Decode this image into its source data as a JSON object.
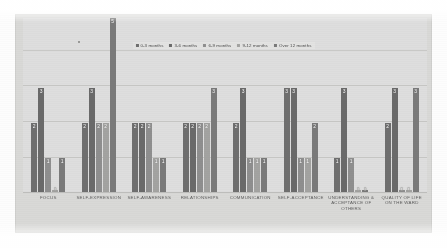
{
  "chart_data": {
    "type": "bar",
    "title": "",
    "xlabel": "",
    "ylabel": "",
    "ylim": [
      0,
      5
    ],
    "grid": true,
    "legend_position": "top-center",
    "categories": [
      "FOCUS",
      "SELF-EXPRESSION",
      "SELF-AWARENESS",
      "RELATIONSHIPS",
      "COMMUNICATION",
      "SELF-ACCEPTANCE",
      "UNDERSTANDING & ACCEPTANCE OF OTHERS",
      "QUALITY OF LIFE ON THE WARD"
    ],
    "series": [
      {
        "name": "0-3 months",
        "color": "#6f6f6f",
        "values": [
          2,
          2,
          2,
          2,
          2,
          3,
          1,
          2
        ]
      },
      {
        "name": "3-6 months",
        "color": "#6a6a6a",
        "values": [
          3,
          3,
          2,
          2,
          3,
          3,
          3,
          3
        ]
      },
      {
        "name": "6-9 months",
        "color": "#8f8f8f",
        "values": [
          1,
          2,
          2,
          2,
          1,
          1,
          1,
          0
        ]
      },
      {
        "name": "9-12 months",
        "color": "#a3a3a1",
        "values": [
          0,
          2,
          1,
          2,
          1,
          1,
          0,
          0
        ]
      },
      {
        "name": "Over 12 months",
        "color": "#7a7a7a",
        "values": [
          1,
          5,
          1,
          3,
          1,
          2,
          0,
          3
        ]
      }
    ]
  },
  "legend": {
    "items": [
      {
        "label": "0-3 months"
      },
      {
        "label": "3-6 months"
      },
      {
        "label": "6-9 months"
      },
      {
        "label": "9-12 months"
      },
      {
        "label": "Over 12 months"
      }
    ]
  }
}
